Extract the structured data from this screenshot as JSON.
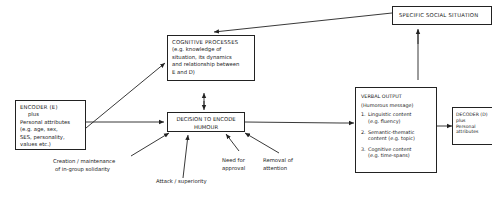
{
  "diagram": {
    "encoder": {
      "title": "ENCODER (E)",
      "plus": "plus",
      "lines": [
        "Personal attributes",
        "(e.g. age, sex,",
        "SES, personality,",
        "values etc.)"
      ]
    },
    "cognitive": {
      "title": "COGNITIVE PROCESSES",
      "lines": [
        "(e.g. knowledge of",
        "situation, its dynamics",
        "and relationship between",
        "E and D)"
      ]
    },
    "social": {
      "title": "SPECIFIC SOCIAL SITUATION"
    },
    "decision": {
      "line1": "DECISION TO ENCODE",
      "line2": "HUMOUR"
    },
    "verbal": {
      "title": "VERBAL OUTPUT",
      "subtitle": "(Humorous message)",
      "items": [
        {
          "num": "1.",
          "line1": "Linguistic content",
          "line2": "(e.g. fluency)"
        },
        {
          "num": "2.",
          "line1": "Semantic-thematic",
          "line2": "content (e.g. topic)"
        },
        {
          "num": "3.",
          "line1": "Cognitive content",
          "line2": "(e.g. time-spans)"
        }
      ]
    },
    "decoder": {
      "title": "DECODER (D)",
      "plus": "plus",
      "line1": "Personal",
      "line2": "attributes"
    },
    "motives": {
      "solidarity": [
        "Creation / maintenance",
        "of in-group solidarity"
      ],
      "superiority": "Attack / superiority",
      "approval": [
        "Need for",
        "approval"
      ],
      "attention": [
        "Removal of",
        "attention"
      ]
    }
  }
}
